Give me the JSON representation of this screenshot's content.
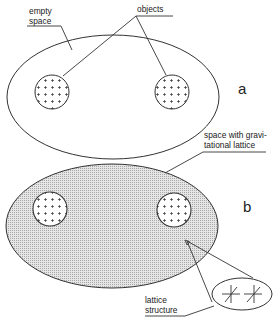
{
  "diagram": {
    "panels": [
      {
        "id": "a",
        "label": "a",
        "region_label": "empty space",
        "objects_label": "objects",
        "fill": "none"
      },
      {
        "id": "b",
        "label": "b",
        "region_label_line1": "space with gravi-",
        "region_label_line2": "tational lattice",
        "fill": "dotted-gray",
        "detail_label_line1": "lattice",
        "detail_label_line2": "structure"
      }
    ],
    "empty_space_line1": "empty",
    "empty_space_line2": "space",
    "colors": {
      "stroke": "#333333",
      "lattice_fill": "#d8d8d8",
      "object_fill": "#ffffff"
    }
  }
}
